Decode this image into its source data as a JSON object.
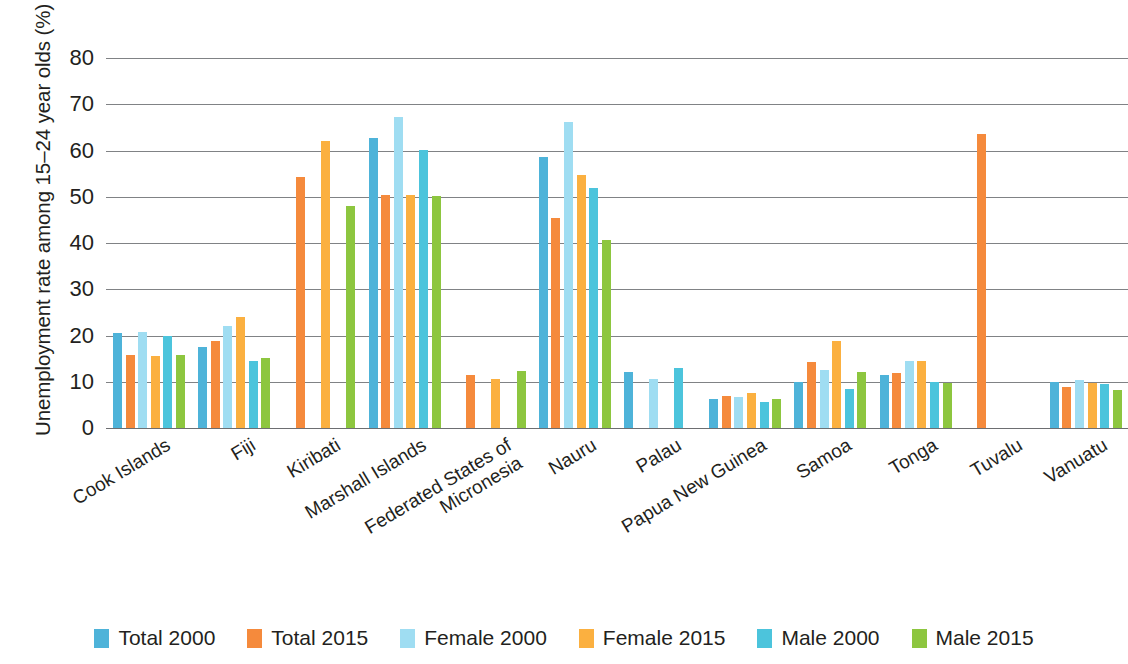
{
  "chart_data": {
    "type": "bar",
    "title": "",
    "subtitle": "",
    "xlabel": "",
    "ylabel": "Unemployment rate among 15–24 year olds (%)",
    "ylim": [
      0,
      80
    ],
    "ytick_labels": [
      "80",
      "70",
      "60",
      "50",
      "40",
      "30",
      "20",
      "10",
      "0"
    ],
    "ytick_values": [
      80,
      70,
      60,
      50,
      40,
      30,
      20,
      10,
      0
    ],
    "grid": true,
    "legend_position": "bottom",
    "categories": [
      "Cook Islands",
      "Fiji",
      "Kiribati",
      "Marshall Islands",
      "Federated States of Micronesia",
      "Nauru",
      "Palau",
      "Papua New Guinea",
      "Samoa",
      "Tonga",
      "Tuvalu",
      "Vanuatu"
    ],
    "series": [
      {
        "name": "Total 2000",
        "color": "#4EB3D9",
        "values": [
          20.5,
          17.5,
          null,
          62.8,
          null,
          58.5,
          12.2,
          6.2,
          10.0,
          11.5,
          null,
          10.0
        ]
      },
      {
        "name": "Total 2015",
        "color": "#F58A3C",
        "values": [
          15.7,
          18.8,
          54.2,
          50.3,
          11.5,
          45.5,
          null,
          7.0,
          14.3,
          11.8,
          63.6,
          8.8
        ]
      },
      {
        "name": "Female 2000",
        "color": "#9FDDF2",
        "values": [
          20.7,
          22.0,
          null,
          67.3,
          null,
          66.2,
          10.6,
          6.8,
          12.6,
          14.5,
          null,
          10.3
        ]
      },
      {
        "name": "Female 2015",
        "color": "#FBB040",
        "values": [
          15.5,
          24.0,
          62.0,
          50.3,
          10.5,
          54.6,
          null,
          7.5,
          18.8,
          14.5,
          null,
          9.7
        ]
      },
      {
        "name": "Male 2000",
        "color": "#4CC4DC",
        "values": [
          20.0,
          14.5,
          null,
          60.2,
          null,
          51.8,
          13.0,
          5.6,
          8.5,
          10.0,
          null,
          9.6
        ]
      },
      {
        "name": "Male 2015",
        "color": "#8DC63F",
        "values": [
          15.8,
          15.2,
          48.0,
          50.2,
          12.4,
          40.6,
          null,
          6.3,
          12.2,
          9.8,
          null,
          8.3
        ]
      }
    ]
  },
  "legend": {
    "items": [
      {
        "label": "Total 2000",
        "color": "#4EB3D9"
      },
      {
        "label": "Total 2015",
        "color": "#F58A3C"
      },
      {
        "label": "Female 2000",
        "color": "#9FDDF2"
      },
      {
        "label": "Female 2015",
        "color": "#FBB040"
      },
      {
        "label": "Male 2000",
        "color": "#4CC4DC"
      },
      {
        "label": "Male 2015",
        "color": "#8DC63F"
      }
    ]
  },
  "colors": {
    "gridline": "#808285",
    "text": "#231f20",
    "background": "#ffffff"
  }
}
